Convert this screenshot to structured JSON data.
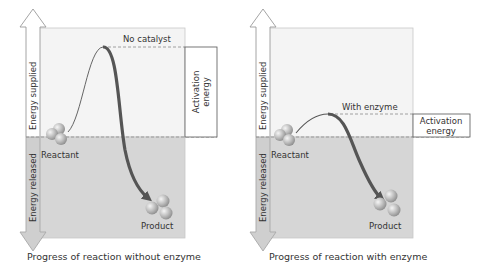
{
  "colors": {
    "background": "#ffffff",
    "upper_region": "#f4f4f4",
    "lower_region": "#d6d6d6",
    "curve": "#555555",
    "dashed_line": "#8a8a8a",
    "arrow_outline": "#999999",
    "down_arrow_fill": "#cfcfcf",
    "molecule": "#b9b9b9",
    "text": "#333333"
  },
  "panels": [
    {
      "id": "without-enzyme",
      "axis_up_label": "Energy supplied",
      "axis_down_label": "Energy released",
      "peak_label": "No catalyst",
      "activation_label_line1": "Activation",
      "activation_label_line2": "energy",
      "reactant_label": "Reactant",
      "product_label": "Product",
      "caption": "Progress of reaction without enzyme"
    },
    {
      "id": "with-enzyme",
      "axis_up_label": "Energy supplied",
      "axis_down_label": "Energy released",
      "peak_label": "With enzyme",
      "activation_label_line1": "Activation",
      "activation_label_line2": "energy",
      "reactant_label": "Reactant",
      "product_label": "Product",
      "caption": "Progress of reaction with enzyme"
    }
  ]
}
